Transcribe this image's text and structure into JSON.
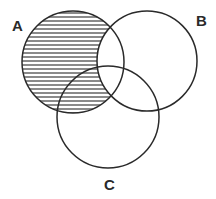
{
  "diagram": {
    "type": "venn",
    "sets": [
      {
        "id": "A",
        "label": "A",
        "cx": 73,
        "cy": 62,
        "r": 51
      },
      {
        "id": "B",
        "label": "B",
        "cx": 147,
        "cy": 61,
        "r": 50
      },
      {
        "id": "C",
        "label": "C",
        "cx": 108,
        "cy": 117,
        "r": 51
      }
    ],
    "shaded_region": "A minus B (horizontal hatching)",
    "labels": {
      "a": "A",
      "b": "B",
      "c": "C"
    },
    "colors": {
      "stroke": "#2a2a2a",
      "hatch": "#2a2a2a",
      "background": "#ffffff"
    }
  }
}
